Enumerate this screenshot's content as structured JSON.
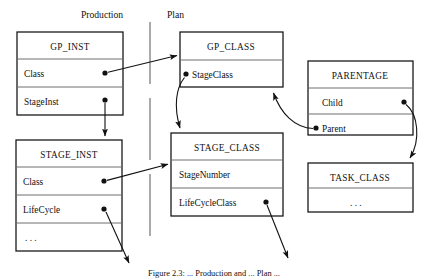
{
  "figure": {
    "caption": "Figure 2.3: ... Production and ... Plan ...",
    "headings": {
      "left": "Production",
      "right": "Plan"
    }
  },
  "entities": [
    {
      "id": "gp_inst",
      "title": "GP_INST",
      "rows": [
        "Class",
        "StageInst"
      ]
    },
    {
      "id": "stage_inst",
      "title": "STAGE_INST",
      "rows": [
        "Class",
        "LifeCycle",
        ". . ."
      ]
    },
    {
      "id": "gp_class",
      "title": "GP_CLASS",
      "rows": [
        "StageClass"
      ]
    },
    {
      "id": "stage_class",
      "title": "STAGE_CLASS",
      "rows": [
        "StageNumber",
        "LifeCycleClass"
      ]
    },
    {
      "id": "parentage",
      "title": "PARENTAGE",
      "rows": [
        "Child",
        "Parent"
      ]
    },
    {
      "id": "task_class",
      "title": "TASK_CLASS",
      "rows": [
        ". . ."
      ]
    }
  ],
  "relationships": [
    {
      "from": "gp_inst.Class",
      "to": "gp_class",
      "style": "straight"
    },
    {
      "from": "gp_inst.StageInst",
      "to": "stage_inst",
      "style": "straight"
    },
    {
      "from": "stage_inst.Class",
      "to": "stage_class",
      "style": "straight"
    },
    {
      "from": "stage_inst.LifeCycle",
      "to": "offpage",
      "style": "straight"
    },
    {
      "from": "gp_class.StageClass",
      "to": "stage_class",
      "style": "curved"
    },
    {
      "from": "stage_class.LifeCycleClass",
      "to": "offpage",
      "style": "straight"
    },
    {
      "from": "parentage.Parent",
      "to": "gp_class",
      "style": "curved"
    },
    {
      "from": "parentage.Child",
      "to": "task_class",
      "style": "curved"
    }
  ],
  "colors": {
    "line": "#111111",
    "separator": "#6f6f6f",
    "divider": "#7d7d7d",
    "background": "#ffffff"
  }
}
